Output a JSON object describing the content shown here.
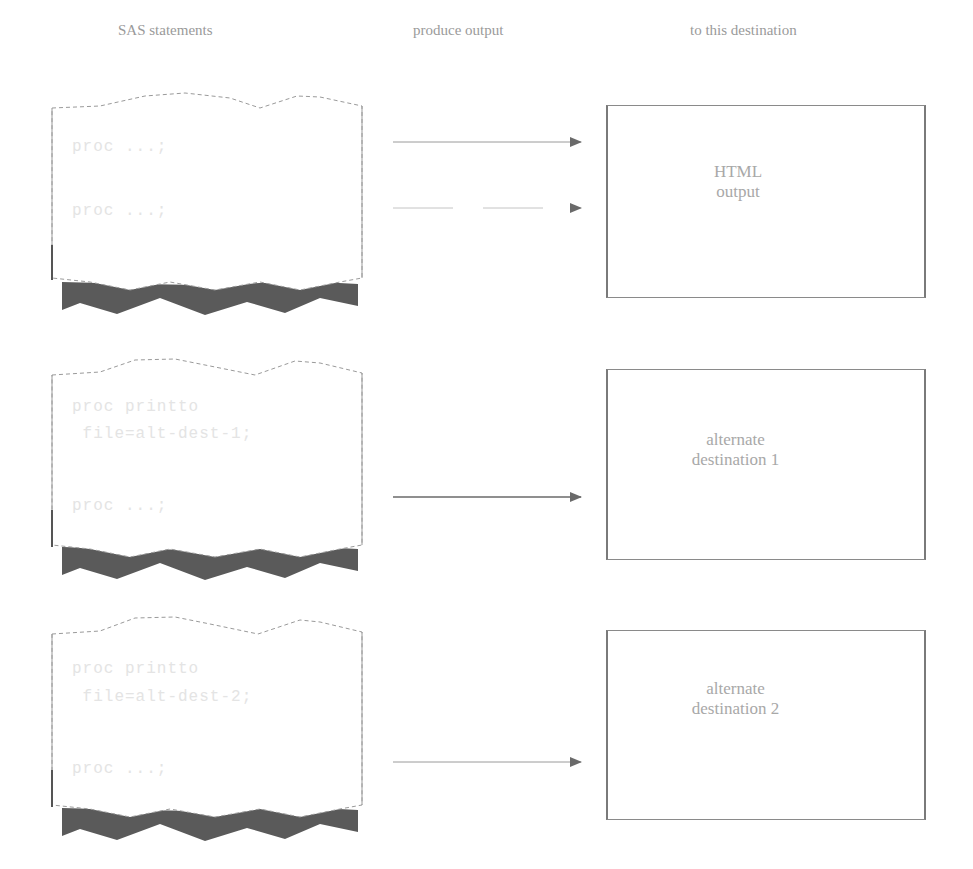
{
  "headers": {
    "statements": "SAS statements",
    "produce": "produce output",
    "destination": "to this destination"
  },
  "rows": [
    {
      "code": [
        "proc ...;",
        "proc ...;"
      ],
      "destination": [
        "HTML",
        "output"
      ]
    },
    {
      "code": [
        "proc printto",
        " file=alt-dest-1;",
        "proc ...;"
      ],
      "destination": [
        "alternate",
        "destination 1"
      ]
    },
    {
      "code": [
        "proc printto",
        " file=alt-dest-2;",
        "proc ...;"
      ],
      "destination": [
        "alternate",
        "destination 2"
      ]
    }
  ],
  "colors": {
    "page_outline": "#9a9a9a",
    "page_shadow": "#5a5a5a",
    "arrow": "#7a7a7a",
    "box_border": "#7a7a7a",
    "text": "#a8a8a8"
  }
}
